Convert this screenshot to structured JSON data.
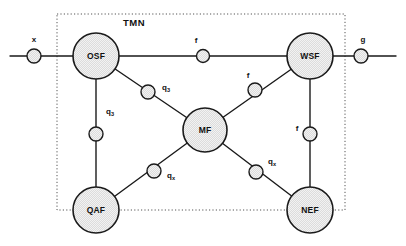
{
  "diagram": {
    "title": "TMN",
    "title_position": {
      "x": 134,
      "y": 26
    },
    "boundary": {
      "name": "tmn-boundary",
      "style": "dotted",
      "x": 57,
      "y": 14,
      "width": 288,
      "height": 196,
      "color": "#555555"
    },
    "canvas": {
      "width": 406,
      "height": 246
    },
    "colors": {
      "node_fill": "#d8d8d8",
      "node_stroke": "#1a1a1a",
      "edge_stroke": "#1a1a1a",
      "interface_fill": "#d8d8d8",
      "text": "#111111",
      "boundary": "#555555",
      "background": "#ffffff"
    },
    "nodes": [
      {
        "id": "osf",
        "label": "OSF",
        "x": 96,
        "y": 56,
        "r": 23
      },
      {
        "id": "wsf",
        "label": "WSF",
        "x": 310,
        "y": 56,
        "r": 23
      },
      {
        "id": "mf",
        "label": "MF",
        "x": 205,
        "y": 130,
        "r": 22
      },
      {
        "id": "qaf",
        "label": "QAF",
        "x": 96,
        "y": 210,
        "r": 23
      },
      {
        "id": "nef",
        "label": "NEF",
        "x": 310,
        "y": 210,
        "r": 23
      }
    ],
    "edges": [
      {
        "id": "e-ext-left-osf",
        "from": "ext-left",
        "to": "osf",
        "x1": 10,
        "y1": 56,
        "x2": 96,
        "y2": 56
      },
      {
        "id": "e-osf-wsf",
        "from": "osf",
        "to": "wsf",
        "x1": 96,
        "y1": 56,
        "x2": 310,
        "y2": 56
      },
      {
        "id": "e-wsf-ext-right",
        "from": "wsf",
        "to": "ext-right",
        "x1": 310,
        "y1": 56,
        "x2": 396,
        "y2": 56
      },
      {
        "id": "e-osf-qaf",
        "from": "osf",
        "to": "qaf",
        "x1": 96,
        "y1": 56,
        "x2": 96,
        "y2": 210
      },
      {
        "id": "e-osf-mf",
        "from": "osf",
        "to": "mf",
        "x1": 96,
        "y1": 56,
        "x2": 205,
        "y2": 130
      },
      {
        "id": "e-mf-wsf",
        "from": "mf",
        "to": "wsf",
        "x1": 205,
        "y1": 130,
        "x2": 310,
        "y2": 56
      },
      {
        "id": "e-mf-qaf",
        "from": "mf",
        "to": "qaf",
        "x1": 205,
        "y1": 130,
        "x2": 96,
        "y2": 210
      },
      {
        "id": "e-mf-nef",
        "from": "mf",
        "to": "nef",
        "x1": 205,
        "y1": 130,
        "x2": 310,
        "y2": 210
      },
      {
        "id": "e-wsf-nef",
        "from": "wsf",
        "to": "nef",
        "x1": 310,
        "y1": 56,
        "x2": 310,
        "y2": 210
      }
    ],
    "interfaces": [
      {
        "id": "if-x",
        "label": "x",
        "sub": "",
        "x": 34,
        "y": 56,
        "r": 7,
        "lx": 34,
        "ly": 42
      },
      {
        "id": "if-f-top",
        "label": "f",
        "sub": "",
        "x": 203,
        "y": 56,
        "r": 6.5,
        "lx": 196,
        "ly": 43
      },
      {
        "id": "if-g",
        "label": "g",
        "sub": "",
        "x": 361,
        "y": 56,
        "r": 7,
        "lx": 363,
        "ly": 42
      },
      {
        "id": "if-q3-diag",
        "label": "q",
        "sub": "3",
        "x": 148,
        "y": 92,
        "r": 7,
        "lx": 166,
        "ly": 90
      },
      {
        "id": "if-f-diag",
        "label": "f",
        "sub": "",
        "x": 255,
        "y": 90,
        "r": 7,
        "lx": 248,
        "ly": 78
      },
      {
        "id": "if-q3-left",
        "label": "q",
        "sub": "3",
        "x": 96,
        "y": 134,
        "r": 7,
        "lx": 110,
        "ly": 114
      },
      {
        "id": "if-f-right",
        "label": "f",
        "sub": "",
        "x": 310,
        "y": 134,
        "r": 7,
        "lx": 297,
        "ly": 131
      },
      {
        "id": "if-qx-left",
        "label": "q",
        "sub": "x",
        "x": 154,
        "y": 171,
        "r": 7,
        "lx": 171,
        "ly": 178
      },
      {
        "id": "if-qx-right",
        "label": "q",
        "sub": "x",
        "x": 256,
        "y": 172,
        "r": 7,
        "lx": 272,
        "ly": 164
      }
    ],
    "external_labels": [
      {
        "id": "ext-label-x",
        "text": "x",
        "x": 34,
        "y": 42
      },
      {
        "id": "ext-label-g",
        "text": "g",
        "x": 363,
        "y": 42
      }
    ]
  }
}
